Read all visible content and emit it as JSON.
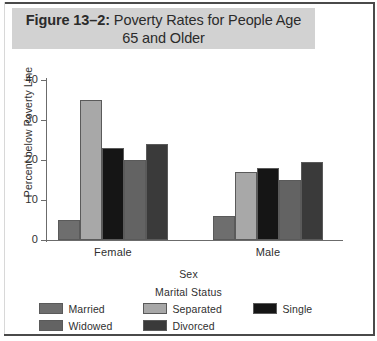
{
  "figure": {
    "title_prefix": "Figure 13–2:",
    "title_rest": " Poverty Rates for People Age 65 and Older",
    "band_color": "#d2d2d2"
  },
  "chart_data": {
    "type": "bar",
    "title": "Figure 13–2: Poverty Rates for People Age 65 and Older",
    "xlabel": "Sex",
    "ylabel": "Percent below Poverty Line",
    "categories": [
      "Female",
      "Male"
    ],
    "ylim": [
      0,
      40
    ],
    "yticks": [
      0,
      10,
      20,
      30,
      40
    ],
    "ytick_labels": [
      "0",
      "10",
      "20",
      "30",
      "40"
    ],
    "grid": false,
    "legend_title": "Marital Status",
    "legend_position": "bottom",
    "series": [
      {
        "name": "Married",
        "color": "#6e6e6e",
        "values": [
          5,
          6
        ]
      },
      {
        "name": "Separated",
        "color": "#a8a8a8",
        "values": [
          35,
          17
        ]
      },
      {
        "name": "Single",
        "color": "#151515",
        "values": [
          23,
          18
        ]
      },
      {
        "name": "Widowed",
        "color": "#636363",
        "values": [
          20,
          15
        ]
      },
      {
        "name": "Divorced",
        "color": "#3a3a3a",
        "values": [
          24,
          19.5
        ]
      }
    ]
  },
  "legend_layout": {
    "row1": [
      "Married",
      "Separated",
      "Single"
    ],
    "row2": [
      "Widowed",
      "Divorced"
    ]
  }
}
